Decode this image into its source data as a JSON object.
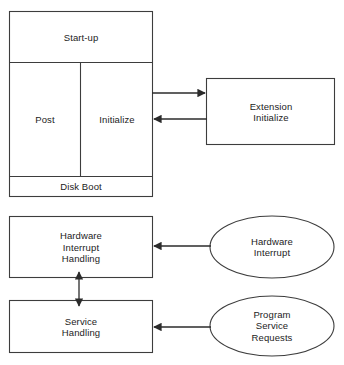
{
  "diagram": {
    "background_color": "#ffffff",
    "line_color": "#3d3d3d",
    "text_color": "#1c1c1c",
    "nodes": {
      "startup": {
        "label": "Start-up",
        "shape": "rectangle"
      },
      "post": {
        "label": "Post",
        "shape": "rectangle"
      },
      "initialize": {
        "label": "Initialize",
        "shape": "rectangle"
      },
      "disk_boot": {
        "label": "Disk Boot",
        "shape": "rectangle"
      },
      "extension_initialize": {
        "label": "Extension\nInitialize",
        "shape": "rectangle"
      },
      "hardware_interrupt_handling": {
        "label": "Hardware\nInterrupt\nHandling",
        "shape": "rectangle"
      },
      "service_handling": {
        "label": "Service\nHandling",
        "shape": "rectangle"
      },
      "hardware_interrupt": {
        "label": "Hardware\nInterrupt",
        "shape": "ellipse"
      },
      "program_service_requests": {
        "label": "Program\nService\nRequests",
        "shape": "ellipse"
      }
    },
    "connectors": [
      {
        "name": "initialize-to-extension",
        "from": "initialize",
        "to": "extension_initialize",
        "direction": "right",
        "arrowheads": 1
      },
      {
        "name": "extension-to-initialize",
        "from": "extension_initialize",
        "to": "initialize",
        "direction": "left",
        "arrowheads": 1
      },
      {
        "name": "hardware-interrupt-to-handling",
        "from": "hardware_interrupt",
        "to": "hardware_interrupt_handling",
        "direction": "left",
        "arrowheads": 1
      },
      {
        "name": "program-requests-to-service-handling",
        "from": "program_service_requests",
        "to": "service_handling",
        "direction": "left",
        "arrowheads": 1
      },
      {
        "name": "interrupt-handling-service-handling",
        "from": "hardware_interrupt_handling",
        "to": "service_handling",
        "direction": "both",
        "arrowheads": 2
      }
    ]
  }
}
